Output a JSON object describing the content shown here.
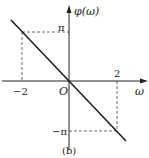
{
  "diagram": {
    "caption": "(b)",
    "y_axis_label": "φ(ω)",
    "x_axis_label": "ω",
    "origin_label": "O",
    "ticks": {
      "x_neg": "−2",
      "x_pos": "2",
      "y_pos": "π",
      "y_neg": "−π"
    },
    "line": {
      "description": "phase φ(ω) = −(π/2)·ω, linear, passing through origin",
      "points": [
        {
          "x": -2,
          "y": "π"
        },
        {
          "x": 0,
          "y": 0
        },
        {
          "x": 2,
          "y": "−π"
        }
      ]
    },
    "colors": {
      "line": "#1a1a1a",
      "axes": "#222222",
      "dashed_guides": "#444444"
    }
  }
}
